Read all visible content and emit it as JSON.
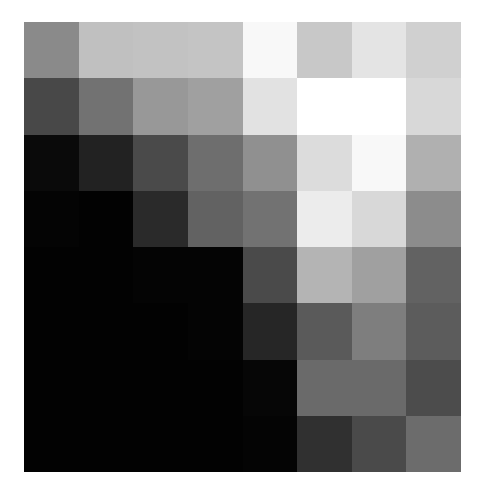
{
  "chart_data": {
    "type": "heatmap",
    "title": "",
    "xlabel": "",
    "ylabel": "",
    "colormap": "gray",
    "rows": 8,
    "cols": 8,
    "grid": false,
    "legend": "none",
    "value_range": [
      0,
      255
    ],
    "values": [
      [
        138,
        192,
        194,
        196,
        248,
        200,
        228,
        208
      ],
      [
        72,
        114,
        152,
        160,
        226,
        255,
        255,
        216
      ],
      [
        10,
        34,
        74,
        110,
        144,
        220,
        248,
        176
      ],
      [
        4,
        2,
        42,
        98,
        114,
        236,
        216,
        140
      ],
      [
        2,
        2,
        4,
        4,
        74,
        180,
        160,
        98
      ],
      [
        2,
        2,
        2,
        4,
        38,
        90,
        126,
        92
      ],
      [
        2,
        2,
        2,
        2,
        6,
        106,
        106,
        76
      ],
      [
        2,
        2,
        2,
        2,
        4,
        48,
        74,
        108
      ]
    ]
  }
}
